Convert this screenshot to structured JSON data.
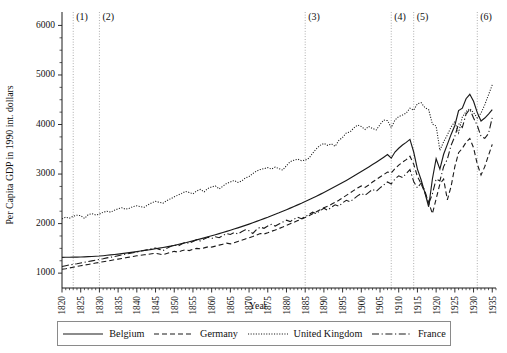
{
  "chart_data": {
    "type": "line",
    "title": "",
    "xlabel": "Year",
    "ylabel": "Per Capita GDP in 1990 int. dollars",
    "xlim": [
      1820,
      1936
    ],
    "ylim": [
      700,
      6150
    ],
    "xticks": [
      1820,
      1825,
      1830,
      1835,
      1840,
      1845,
      1850,
      1855,
      1860,
      1865,
      1870,
      1875,
      1880,
      1885,
      1890,
      1895,
      1900,
      1905,
      1910,
      1915,
      1920,
      1925,
      1930,
      1935
    ],
    "yticks": [
      1000,
      2000,
      3000,
      4000,
      5000,
      6000
    ],
    "grid": false,
    "legend_position": "bottom",
    "annotations": [
      {
        "label": "(1)",
        "x": 1823
      },
      {
        "label": "(2)",
        "x": 1830
      },
      {
        "label": "(3)",
        "x": 1885
      },
      {
        "label": "(4)",
        "x": 1908
      },
      {
        "label": "(5)",
        "x": 1914
      },
      {
        "label": "(6)",
        "x": 1931
      }
    ],
    "x": [
      1820,
      1821,
      1822,
      1823,
      1824,
      1825,
      1826,
      1827,
      1828,
      1829,
      1830,
      1831,
      1832,
      1833,
      1834,
      1835,
      1836,
      1837,
      1838,
      1839,
      1840,
      1841,
      1842,
      1843,
      1844,
      1845,
      1846,
      1847,
      1848,
      1849,
      1850,
      1851,
      1852,
      1853,
      1854,
      1855,
      1856,
      1857,
      1858,
      1859,
      1860,
      1861,
      1862,
      1863,
      1864,
      1865,
      1866,
      1867,
      1868,
      1869,
      1870,
      1871,
      1872,
      1873,
      1874,
      1875,
      1876,
      1877,
      1878,
      1879,
      1880,
      1881,
      1882,
      1883,
      1884,
      1885,
      1886,
      1887,
      1888,
      1889,
      1890,
      1891,
      1892,
      1893,
      1894,
      1895,
      1896,
      1897,
      1898,
      1899,
      1900,
      1901,
      1902,
      1903,
      1904,
      1905,
      1906,
      1907,
      1908,
      1909,
      1910,
      1911,
      1912,
      1913,
      1914,
      1915,
      1916,
      1917,
      1918,
      1919,
      1920,
      1921,
      1922,
      1923,
      1924,
      1925,
      1926,
      1927,
      1928,
      1929,
      1930,
      1931,
      1932,
      1933,
      1934,
      1935
    ],
    "series": [
      {
        "name": "Belgium",
        "style": "solid",
        "values": [
          1319,
          1320,
          1321,
          1322,
          1323,
          1325,
          1328,
          1332,
          1336,
          1340,
          1345,
          1352,
          1360,
          1368,
          1376,
          1385,
          1394,
          1404,
          1414,
          1424,
          1435,
          1446,
          1457,
          1468,
          1480,
          1492,
          1504,
          1517,
          1530,
          1544,
          1560,
          1578,
          1596,
          1614,
          1633,
          1652,
          1672,
          1692,
          1712,
          1733,
          1754,
          1776,
          1798,
          1820,
          1843,
          1866,
          1890,
          1914,
          1939,
          1964,
          1990,
          2017,
          2045,
          2074,
          2100,
          2128,
          2158,
          2188,
          2218,
          2250,
          2280,
          2312,
          2345,
          2378,
          2410,
          2445,
          2480,
          2516,
          2552,
          2590,
          2628,
          2667,
          2707,
          2747,
          2788,
          2830,
          2872,
          2915,
          2959,
          3004,
          3050,
          3096,
          3143,
          3191,
          3240,
          3290,
          3341,
          3393,
          3320,
          3445,
          3520,
          3586,
          3640,
          3700,
          3445,
          3100,
          2880,
          2620,
          2340,
          2900,
          3310,
          3100,
          3400,
          3600,
          3800,
          3980,
          4280,
          4330,
          4520,
          4610,
          4470,
          4240,
          4070,
          4130,
          4210,
          4300
        ]
      },
      {
        "name": "Germany",
        "style": "dashed",
        "values": [
          1077,
          1090,
          1105,
          1120,
          1135,
          1150,
          1163,
          1176,
          1190,
          1203,
          1216,
          1230,
          1243,
          1256,
          1270,
          1283,
          1296,
          1310,
          1323,
          1336,
          1350,
          1360,
          1370,
          1380,
          1390,
          1400,
          1385,
          1370,
          1395,
          1420,
          1440,
          1425,
          1450,
          1470,
          1455,
          1480,
          1500,
          1490,
          1510,
          1530,
          1525,
          1545,
          1565,
          1585,
          1605,
          1590,
          1615,
          1640,
          1665,
          1690,
          1715,
          1740,
          1770,
          1800,
          1790,
          1815,
          1845,
          1870,
          1900,
          1930,
          1965,
          1995,
          2025,
          2060,
          2090,
          2125,
          2160,
          2200,
          2240,
          2280,
          2320,
          2350,
          2390,
          2430,
          2470,
          2520,
          2570,
          2620,
          2670,
          2720,
          2760,
          2730,
          2780,
          2840,
          2890,
          2940,
          2990,
          3040,
          3020,
          3110,
          3180,
          3240,
          3290,
          3360,
          3200,
          2950,
          2800,
          2620,
          2430,
          2200,
          2500,
          2800,
          2900,
          2480,
          2750,
          3150,
          3430,
          3520,
          3640,
          3720,
          3530,
          3200,
          2980,
          3150,
          3380,
          3600
        ]
      },
      {
        "name": "United Kingdom",
        "style": "dotted",
        "values": [
          2095,
          2130,
          2110,
          2150,
          2170,
          2160,
          2105,
          2180,
          2200,
          2175,
          2190,
          2230,
          2250,
          2230,
          2270,
          2300,
          2320,
          2290,
          2310,
          2345,
          2360,
          2340,
          2330,
          2380,
          2420,
          2450,
          2430,
          2410,
          2465,
          2500,
          2540,
          2575,
          2610,
          2650,
          2630,
          2600,
          2660,
          2690,
          2640,
          2710,
          2740,
          2760,
          2700,
          2755,
          2810,
          2840,
          2870,
          2830,
          2860,
          2920,
          2950,
          3010,
          3060,
          3090,
          3110,
          3130,
          3100,
          3140,
          3110,
          3080,
          3170,
          3250,
          3280,
          3300,
          3270,
          3280,
          3320,
          3420,
          3510,
          3580,
          3620,
          3580,
          3610,
          3560,
          3680,
          3740,
          3830,
          3850,
          3930,
          3990,
          3960,
          3900,
          3960,
          3920,
          3890,
          4000,
          4090,
          4080,
          3940,
          4090,
          4160,
          4190,
          4230,
          4330,
          4290,
          4420,
          4440,
          4340,
          4300,
          4010,
          3970,
          3480,
          3650,
          3790,
          3950,
          4060,
          3830,
          4150,
          4260,
          4320,
          4240,
          4130,
          4230,
          4400,
          4600,
          4800
        ]
      },
      {
        "name": "France",
        "style": "dashdot",
        "values": [
          1135,
          1150,
          1165,
          1178,
          1190,
          1205,
          1220,
          1235,
          1248,
          1262,
          1278,
          1292,
          1308,
          1322,
          1336,
          1352,
          1368,
          1382,
          1398,
          1412,
          1428,
          1444,
          1460,
          1476,
          1492,
          1508,
          1480,
          1455,
          1500,
          1540,
          1570,
          1545,
          1590,
          1625,
          1600,
          1640,
          1675,
          1650,
          1690,
          1725,
          1700,
          1735,
          1715,
          1760,
          1800,
          1780,
          1820,
          1790,
          1835,
          1875,
          1855,
          1800,
          1880,
          1930,
          1905,
          1950,
          1985,
          1950,
          1990,
          2030,
          2070,
          2040,
          2090,
          2130,
          2100,
          2140,
          2185,
          2230,
          2200,
          2260,
          2310,
          2270,
          2330,
          2380,
          2350,
          2420,
          2470,
          2440,
          2500,
          2560,
          2610,
          2570,
          2630,
          2690,
          2650,
          2720,
          2780,
          2840,
          2800,
          2900,
          2965,
          2930,
          3010,
          3090,
          2850,
          2720,
          2820,
          2660,
          2400,
          2600,
          2900,
          2860,
          3150,
          3300,
          3580,
          3760,
          4020,
          3940,
          4210,
          4310,
          4130,
          3980,
          3760,
          3720,
          3820,
          4140
        ]
      }
    ]
  },
  "axis": {
    "y_title": "Per Capita GDP in 1990 int. dollars",
    "x_title": "Year"
  },
  "legend": {
    "items": [
      {
        "label": "Belgium",
        "style": "solid"
      },
      {
        "label": "Germany",
        "style": "dashed"
      },
      {
        "label": "United Kingdom",
        "style": "dotted"
      },
      {
        "label": "France",
        "style": "dashdot"
      }
    ]
  }
}
